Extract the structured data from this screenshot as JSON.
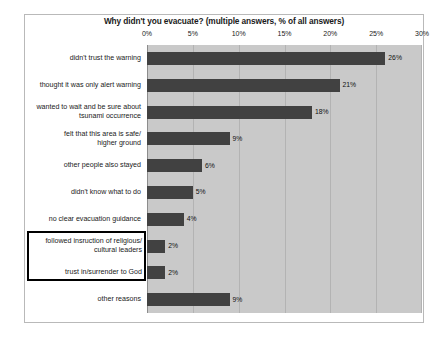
{
  "chart_data": {
    "type": "bar",
    "orientation": "horizontal",
    "title": "Why didn't you evacuate? (multiple answers, % of all answers)",
    "xlabel": "",
    "ylabel": "",
    "xlim": [
      0,
      30
    ],
    "xticks": [
      "0%",
      "5%",
      "10%",
      "15%",
      "20%",
      "25%",
      "30%"
    ],
    "xtick_values": [
      0,
      5,
      10,
      15,
      20,
      25,
      30
    ],
    "grid": true,
    "legend": "none",
    "categories": [
      "didn't trust the warning",
      "thought it was only alert warning",
      "wanted to wait and be sure about\ntsunami occurrence",
      "felt that this area is safe/\nhigher ground",
      "other people also stayed",
      "didn't know what to do",
      "no clear evacuation guidance",
      "followed insruction of religious/\ncultural leaders",
      "trust in/surrender to God",
      "other reasons"
    ],
    "values": [
      26,
      21,
      18,
      9,
      6,
      5,
      4,
      2,
      2,
      9
    ],
    "value_labels": [
      "26%",
      "21%",
      "18%",
      "9%",
      "6%",
      "5%",
      "4%",
      "2%",
      "2%",
      "9%"
    ],
    "highlighted_categories": [
      "followed insruction of religious/\ncultural leaders",
      "trust in/surrender to God"
    ],
    "colors": {
      "bar": "#414141",
      "plot_background": "#c9c9c9",
      "gridline": "#b3b3b3",
      "frame": "#b9b9b9",
      "highlight_border": "#000000",
      "highlight_fill": "#ffffff",
      "text": "#1a1a1a"
    }
  }
}
